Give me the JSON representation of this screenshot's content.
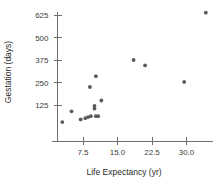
{
  "chart_data": {
    "type": "scatter",
    "title": "",
    "xlabel": "Life Expectancy (yr)",
    "ylabel": "Gestation (days)",
    "xlim": [
      0,
      36
    ],
    "ylim": [
      0,
      670
    ],
    "grid": false,
    "legend": null,
    "xticks": [
      7.5,
      15.0,
      22.5,
      30.0
    ],
    "xtick_labels": [
      "7.5",
      "15.0",
      "22.5",
      "30.0"
    ],
    "yticks": [
      125,
      250,
      375,
      500,
      625
    ],
    "ytick_labels": [
      "125",
      "250",
      "375",
      "500",
      "625"
    ],
    "point_color": "#59595f",
    "axis_color": "#6e6e6e",
    "points": [
      {
        "x": 3.0,
        "y": 30
      },
      {
        "x": 5.0,
        "y": 90
      },
      {
        "x": 7.0,
        "y": 45
      },
      {
        "x": 8.0,
        "y": 52
      },
      {
        "x": 8.6,
        "y": 58
      },
      {
        "x": 9.2,
        "y": 63
      },
      {
        "x": 10.0,
        "y": 105
      },
      {
        "x": 10.0,
        "y": 120
      },
      {
        "x": 10.3,
        "y": 63
      },
      {
        "x": 10.8,
        "y": 63
      },
      {
        "x": 11.5,
        "y": 150
      },
      {
        "x": 10.3,
        "y": 285
      },
      {
        "x": 9.0,
        "y": 225
      },
      {
        "x": 18.5,
        "y": 375
      },
      {
        "x": 21.0,
        "y": 345
      },
      {
        "x": 29.5,
        "y": 253
      },
      {
        "x": 34.2,
        "y": 638
      }
    ]
  },
  "axis_titles": {
    "x": "Life Expectancy (yr)",
    "y": "Gestation (days)"
  }
}
